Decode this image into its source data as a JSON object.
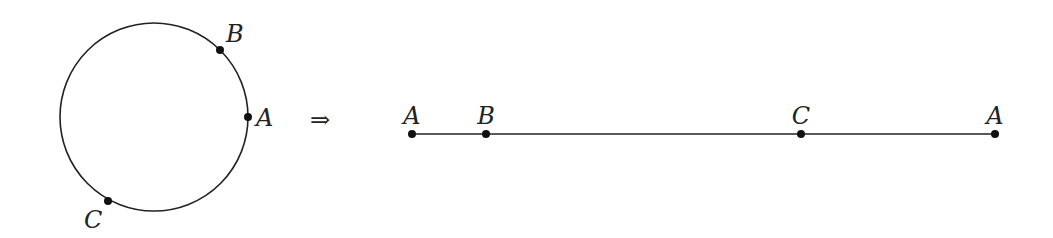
{
  "diagram": {
    "circle": {
      "center": [
        154,
        117
      ],
      "radius": 94,
      "points": [
        {
          "label": "B",
          "x": 220,
          "y": 50,
          "label_x": 226,
          "label_y": 42
        },
        {
          "label": "A",
          "x": 248,
          "y": 117,
          "label_x": 256,
          "label_y": 126
        },
        {
          "label": "C",
          "x": 108,
          "y": 201,
          "label_x": 84,
          "label_y": 228
        }
      ]
    },
    "arrow": {
      "symbol": "⇒",
      "x": 310,
      "y": 128
    },
    "line": {
      "x1": 412,
      "x2": 995,
      "y": 134,
      "points": [
        {
          "label": "A",
          "x": 412
        },
        {
          "label": "B",
          "x": 486
        },
        {
          "label": "C",
          "x": 801
        },
        {
          "label": "A",
          "x": 995
        }
      ]
    }
  }
}
